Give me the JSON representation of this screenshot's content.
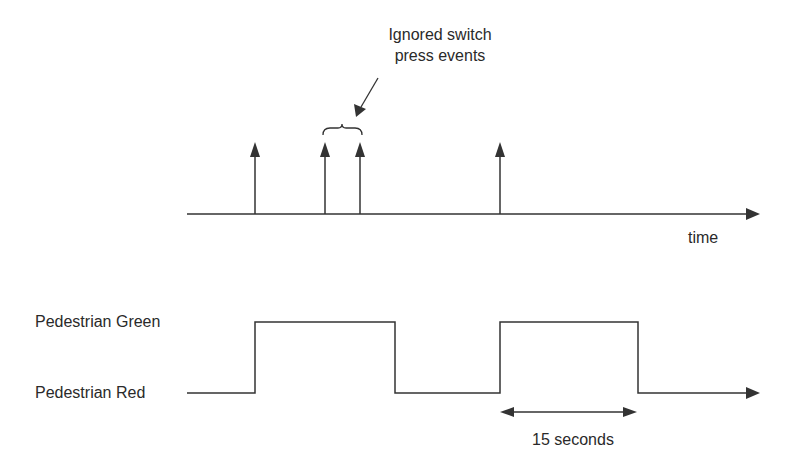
{
  "annotation": {
    "line1": "Ignored switch",
    "line2": "press events"
  },
  "top_axis": {
    "label": "time",
    "events_x": [
      255,
      325,
      360,
      500
    ]
  },
  "signal": {
    "high_label": "Pedestrian Green",
    "low_label": "Pedestrian Red",
    "pulses": [
      {
        "start": 255,
        "end": 395
      },
      {
        "start": 500,
        "end": 638
      }
    ]
  },
  "duration": {
    "label": "15 seconds"
  },
  "colors": {
    "line": "#333333",
    "background": "#ffffff"
  }
}
